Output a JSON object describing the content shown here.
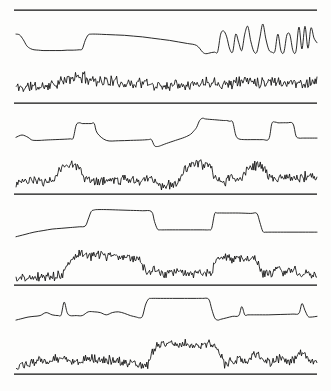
{
  "figure": {
    "background_color": "#fdfdfc",
    "ink_color": "#111111",
    "width": 331,
    "height": 391,
    "separator_color": "#111111"
  },
  "chart_data": {
    "type": "line",
    "subtitle": "",
    "xlabel": "",
    "ylabel": "",
    "grid": false,
    "legend_position": "none",
    "axis_ticks": [],
    "tick_labels": [],
    "annotations": [],
    "xlim": [
      0,
      100
    ],
    "ylim": [
      0,
      1
    ],
    "panel_count": 4,
    "series_per_panel": 2,
    "separators_y": [
      10,
      103,
      194,
      285,
      374
    ],
    "panels": [
      {
        "index": 1,
        "name": "panel-1",
        "separator_top_y": 10,
        "separator_bottom_y": 103,
        "series": [
          {
            "name": "smooth-trace-1",
            "role": "smooth",
            "style": "line",
            "x": [
              0,
              1.2,
              2.4,
              3.6,
              4.8,
              6,
              7.5,
              9,
              11,
              13,
              15,
              17,
              19,
              21,
              22,
              23,
              24,
              25,
              27,
              30,
              33,
              36,
              39,
              42,
              45,
              48,
              51,
              54,
              57,
              60,
              62,
              63,
              64,
              65,
              66,
              67,
              68,
              69,
              70,
              71,
              72,
              73,
              74,
              75,
              76,
              77,
              78,
              79,
              80,
              81,
              82,
              83,
              84,
              85,
              86,
              87,
              88,
              89,
              90,
              91,
              92,
              93,
              94,
              95,
              96,
              97,
              98,
              99,
              100
            ],
            "y": [
              0.62,
              0.6,
              0.48,
              0.32,
              0.25,
              0.22,
              0.21,
              0.2,
              0.2,
              0.2,
              0.2,
              0.21,
              0.21,
              0.22,
              0.24,
              0.46,
              0.6,
              0.62,
              0.62,
              0.61,
              0.6,
              0.59,
              0.57,
              0.55,
              0.52,
              0.49,
              0.46,
              0.42,
              0.38,
              0.33,
              0.16,
              0.12,
              0.13,
              0.15,
              0.16,
              0.17,
              0.62,
              0.7,
              0.55,
              0.24,
              0.17,
              0.62,
              0.4,
              0.2,
              0.62,
              0.82,
              0.44,
              0.18,
              0.16,
              0.52,
              0.88,
              0.5,
              0.22,
              0.16,
              0.18,
              0.62,
              0.2,
              0.16,
              0.6,
              0.6,
              0.2,
              0.18,
              0.8,
              0.24,
              0.82,
              0.26,
              0.78,
              0.52,
              0.4
            ]
          },
          {
            "name": "noisy-trace-1",
            "role": "noisy",
            "style": "line",
            "seed": 11,
            "baseline": [
              0.32,
              0.3,
              0.34,
              0.31,
              0.36,
              0.4,
              0.45,
              0.52,
              0.58,
              0.55,
              0.5,
              0.48,
              0.46,
              0.44,
              0.42,
              0.4,
              0.44,
              0.4,
              0.36,
              0.34,
              0.38,
              0.42,
              0.4,
              0.38,
              0.42,
              0.46,
              0.44,
              0.4,
              0.42,
              0.46,
              0.5,
              0.46,
              0.44,
              0.48,
              0.46,
              0.42,
              0.44,
              0.4,
              0.44,
              0.48
            ],
            "noise_amplitude": 0.22
          }
        ]
      },
      {
        "index": 2,
        "name": "panel-2",
        "separator_top_y": 103,
        "separator_bottom_y": 194,
        "series": [
          {
            "name": "smooth-trace-2",
            "role": "smooth",
            "style": "line",
            "x": [
              0,
              2,
              4,
              5,
              6,
              8,
              10,
              13,
              16,
              18,
              19,
              20,
              21,
              22,
              23,
              24,
              25,
              26,
              27,
              30,
              34,
              38,
              42,
              44,
              45,
              46,
              47,
              48,
              50,
              53,
              56,
              58,
              59,
              60,
              61,
              62,
              63,
              66,
              69,
              70,
              71,
              72,
              73,
              74,
              76,
              78,
              80,
              82,
              84,
              85,
              86,
              87,
              88,
              90,
              92,
              93,
              94,
              95,
              96,
              98,
              100
            ],
            "y": [
              0.34,
              0.4,
              0.34,
              0.28,
              0.26,
              0.26,
              0.27,
              0.28,
              0.29,
              0.3,
              0.32,
              0.66,
              0.72,
              0.7,
              0.7,
              0.7,
              0.7,
              0.7,
              0.45,
              0.26,
              0.25,
              0.26,
              0.27,
              0.28,
              0.28,
              0.12,
              0.1,
              0.12,
              0.18,
              0.26,
              0.34,
              0.42,
              0.5,
              0.6,
              0.78,
              0.84,
              0.82,
              0.8,
              0.78,
              0.78,
              0.76,
              0.74,
              0.4,
              0.3,
              0.28,
              0.28,
              0.28,
              0.28,
              0.3,
              0.7,
              0.74,
              0.72,
              0.72,
              0.72,
              0.7,
              0.38,
              0.32,
              0.32,
              0.32,
              0.32,
              0.32
            ]
          },
          {
            "name": "noisy-trace-2",
            "role": "noisy",
            "style": "line",
            "seed": 23,
            "baseline": [
              0.22,
              0.24,
              0.22,
              0.26,
              0.24,
              0.3,
              0.6,
              0.72,
              0.66,
              0.3,
              0.24,
              0.26,
              0.28,
              0.26,
              0.3,
              0.28,
              0.26,
              0.34,
              0.3,
              0.1,
              0.14,
              0.2,
              0.6,
              0.7,
              0.66,
              0.64,
              0.3,
              0.26,
              0.32,
              0.28,
              0.6,
              0.66,
              0.62,
              0.34,
              0.3,
              0.4,
              0.3,
              0.32,
              0.44,
              0.3
            ],
            "noise_amplitude": 0.2
          }
        ]
      },
      {
        "index": 3,
        "name": "panel-3",
        "separator_top_y": 194,
        "separator_bottom_y": 285,
        "series": [
          {
            "name": "smooth-trace-3",
            "role": "smooth",
            "style": "line",
            "x": [
              0,
              3,
              6,
              9,
              12,
              15,
              18,
              21,
              23,
              24,
              25,
              26,
              27,
              30,
              34,
              38,
              42,
              45,
              46,
              47,
              48,
              50,
              54,
              58,
              62,
              64,
              65,
              66,
              67,
              70,
              74,
              78,
              80,
              81,
              82,
              83,
              84,
              86,
              90,
              94,
              98,
              100
            ],
            "y": [
              0.12,
              0.18,
              0.24,
              0.28,
              0.32,
              0.34,
              0.36,
              0.38,
              0.4,
              0.58,
              0.78,
              0.82,
              0.83,
              0.83,
              0.82,
              0.81,
              0.8,
              0.78,
              0.52,
              0.32,
              0.3,
              0.3,
              0.3,
              0.3,
              0.3,
              0.3,
              0.34,
              0.72,
              0.74,
              0.74,
              0.74,
              0.73,
              0.73,
              0.5,
              0.26,
              0.24,
              0.24,
              0.24,
              0.24,
              0.24,
              0.24,
              0.24
            ]
          },
          {
            "name": "noisy-trace-3",
            "role": "noisy",
            "style": "line",
            "seed": 37,
            "baseline": [
              0.08,
              0.09,
              0.1,
              0.12,
              0.14,
              0.16,
              0.18,
              0.6,
              0.72,
              0.68,
              0.66,
              0.7,
              0.66,
              0.64,
              0.68,
              0.62,
              0.6,
              0.22,
              0.34,
              0.18,
              0.2,
              0.24,
              0.22,
              0.2,
              0.24,
              0.18,
              0.55,
              0.62,
              0.58,
              0.6,
              0.56,
              0.58,
              0.22,
              0.24,
              0.34,
              0.22,
              0.3,
              0.2,
              0.24,
              0.18
            ],
            "noise_amplitude": 0.18
          }
        ]
      },
      {
        "index": 4,
        "name": "panel-4",
        "separator_top_y": 285,
        "separator_bottom_y": 374,
        "series": [
          {
            "name": "smooth-trace-4",
            "role": "smooth",
            "style": "line",
            "x": [
              0,
              2,
              4,
              6,
              8,
              10,
              12,
              14,
              15,
              16,
              17,
              18,
              20,
              22,
              24,
              26,
              28,
              30,
              32,
              34,
              36,
              38,
              40,
              41,
              42,
              43,
              44,
              45,
              48,
              52,
              56,
              60,
              62,
              64,
              65,
              66,
              67,
              68,
              70,
              72,
              74,
              75,
              76,
              77,
              78,
              80,
              84,
              88,
              92,
              94,
              95,
              96,
              97,
              98,
              100
            ],
            "y": [
              0.3,
              0.34,
              0.38,
              0.4,
              0.42,
              0.5,
              0.44,
              0.42,
              0.44,
              0.78,
              0.5,
              0.42,
              0.42,
              0.42,
              0.52,
              0.52,
              0.5,
              0.44,
              0.5,
              0.52,
              0.48,
              0.42,
              0.38,
              0.36,
              0.4,
              0.7,
              0.86,
              0.88,
              0.88,
              0.88,
              0.88,
              0.88,
              0.88,
              0.86,
              0.6,
              0.36,
              0.3,
              0.32,
              0.36,
              0.4,
              0.42,
              0.66,
              0.44,
              0.44,
              0.44,
              0.44,
              0.44,
              0.45,
              0.46,
              0.48,
              0.74,
              0.56,
              0.4,
              0.38,
              0.4
            ]
          },
          {
            "name": "noisy-trace-4",
            "role": "noisy",
            "style": "line",
            "seed": 53,
            "baseline": [
              0.1,
              0.14,
              0.22,
              0.26,
              0.24,
              0.3,
              0.4,
              0.28,
              0.26,
              0.3,
              0.32,
              0.28,
              0.3,
              0.26,
              0.24,
              0.2,
              0.16,
              0.12,
              0.62,
              0.72,
              0.7,
              0.66,
              0.7,
              0.66,
              0.68,
              0.7,
              0.66,
              0.2,
              0.24,
              0.28,
              0.26,
              0.46,
              0.28,
              0.24,
              0.32,
              0.3,
              0.26,
              0.5,
              0.28,
              0.24
            ],
            "noise_amplitude": 0.18
          }
        ]
      }
    ]
  }
}
